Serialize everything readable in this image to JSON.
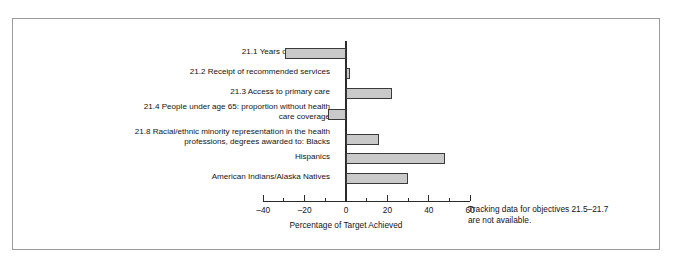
{
  "chart_data": {
    "type": "bar",
    "orientation": "horizontal",
    "title": "",
    "xlabel": "Percentage of Target Achieved",
    "ylabel": "",
    "xlim": [
      -40,
      60
    ],
    "grid": false,
    "legend": null,
    "zero_reference_line": true,
    "categories": [
      "21.1 Years of healthy life",
      "21.2 Receipt of recommended services",
      "21.3 Access to primary care",
      "21.4 People under age 65: proportion without health\ncare coverage",
      "21.8 Racial/ethnic minority representation in the health\nprofessions, degrees awarded to: Blacks",
      "Hispanics",
      "American Indians/Alaska Natives"
    ],
    "values": [
      -29.5,
      2,
      22,
      -8.5,
      16,
      48,
      30
    ],
    "tick_values": [
      -40,
      -20,
      0,
      20,
      40,
      60
    ],
    "tick_labels": [
      "–40",
      "–20",
      "0",
      "20",
      "40",
      "60"
    ],
    "minor_tick_values": [
      -30,
      -10,
      10,
      30,
      50
    ],
    "annotation": "Tracking data for objectives 21.5–21.7\nare not available.",
    "bar_fill_color": "#c9c9c9",
    "bar_edge_color": "#3a3a3a",
    "axis_color": "#2b2b2b",
    "frame_color": "#9a9a9a"
  }
}
